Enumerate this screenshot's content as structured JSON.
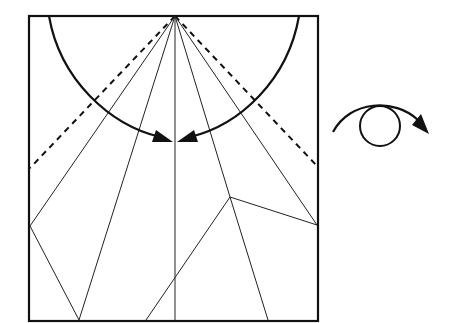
{
  "diagram": {
    "type": "origami-fold-step",
    "colors": {
      "line": "#111111",
      "background": "#ffffff"
    },
    "paper_square": {
      "x1": 29,
      "y1": 16,
      "x2": 318,
      "y2": 321
    },
    "apex": {
      "x": 175,
      "y": 16
    },
    "valley_folds": [
      {
        "from": [
          175,
          16
        ],
        "to": [
          30,
          168
        ]
      },
      {
        "from": [
          175,
          16
        ],
        "to": [
          317,
          166
        ]
      }
    ],
    "creases": [
      {
        "from": [
          175,
          16
        ],
        "to": [
          30,
          226
        ]
      },
      {
        "from": [
          175,
          16
        ],
        "to": [
          79,
          320
        ]
      },
      {
        "from": [
          175,
          16
        ],
        "to": [
          175,
          320
        ]
      },
      {
        "from": [
          175,
          16
        ],
        "to": [
          230,
          197
        ]
      },
      {
        "from": [
          230,
          197
        ],
        "to": [
          268,
          320
        ]
      },
      {
        "from": [
          175,
          16
        ],
        "to": [
          317,
          225
        ]
      },
      {
        "from": [
          30,
          226
        ],
        "to": [
          79,
          320
        ]
      },
      {
        "from": [
          146,
          320
        ],
        "to": [
          230,
          197
        ]
      },
      {
        "from": [
          230,
          197
        ],
        "to": [
          317,
          225
        ]
      }
    ],
    "fold_arrows": [
      {
        "name": "left-fold-arrow",
        "start": [
          49,
          16
        ],
        "tip": [
          173,
          142
        ]
      },
      {
        "name": "right-fold-arrow",
        "start": [
          299,
          16
        ],
        "tip": [
          177,
          142
        ]
      }
    ],
    "turn_over_symbol": {
      "meaning": "turn model over",
      "circle": {
        "cx": 380,
        "cy": 126,
        "r": 20
      },
      "arc_start": [
        333,
        132
      ],
      "arrow_tip": [
        429,
        134
      ]
    }
  }
}
